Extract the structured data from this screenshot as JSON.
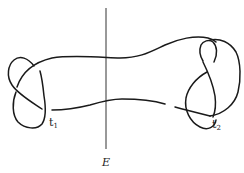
{
  "figure": {
    "type": "knot-diagram",
    "colors": {
      "stroke": "#1a1a1a",
      "background": "#ffffff"
    }
  },
  "labels": {
    "plane": "E",
    "tangle_left_letter": "t",
    "tangle_left_sub": "1",
    "tangle_right_letter": "t",
    "tangle_right_sub": "2"
  }
}
